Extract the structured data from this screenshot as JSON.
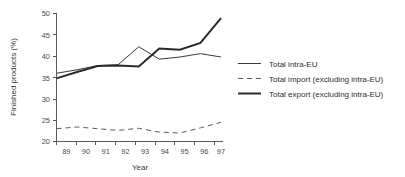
{
  "chart_data": {
    "type": "line",
    "title": "",
    "xlabel": "Year",
    "ylabel": "Finished products (%)",
    "x": [
      89,
      90,
      91,
      92,
      93,
      94,
      95,
      96,
      97
    ],
    "categories": [
      "89",
      "90",
      "91",
      "92",
      "93",
      "94",
      "95",
      "96",
      "97"
    ],
    "xlim": [
      88.5,
      97.3
    ],
    "ylim": [
      20,
      50
    ],
    "yticks": [
      20,
      25,
      30,
      35,
      40,
      45,
      50
    ],
    "ytick_labels": [
      "20",
      "25",
      "30",
      "35",
      "40",
      "45",
      "50"
    ],
    "grid": false,
    "legend_position": "right",
    "series": [
      {
        "name": "Total intra-EU",
        "style": "solid-thin",
        "color": "#3a3a3a",
        "width": 1,
        "values": [
          36.0,
          36.8,
          37.8,
          38.0,
          42.2,
          39.3,
          39.8,
          40.6,
          39.8
        ]
      },
      {
        "name": "Total import (excluding intra-EU)",
        "style": "dashed",
        "color": "#5a5a5a",
        "width": 1,
        "values": [
          23.0,
          23.4,
          23.0,
          22.6,
          23.1,
          22.2,
          22.0,
          23.2,
          24.5
        ]
      },
      {
        "name": "Total export (excluding intra-EU)",
        "style": "solid-thick",
        "color": "#2b2b2b",
        "width": 2,
        "values": [
          34.8,
          36.3,
          37.7,
          37.8,
          37.6,
          41.8,
          41.5,
          43.1,
          48.9
        ]
      }
    ]
  },
  "legend": {
    "items": [
      {
        "label": "Total intra-EU"
      },
      {
        "label": "Total import (excluding intra-EU)"
      },
      {
        "label": "Total export (excluding intra-EU)"
      }
    ]
  },
  "axes": {
    "y_title": "Finished products (%)",
    "x_title": "Year"
  }
}
